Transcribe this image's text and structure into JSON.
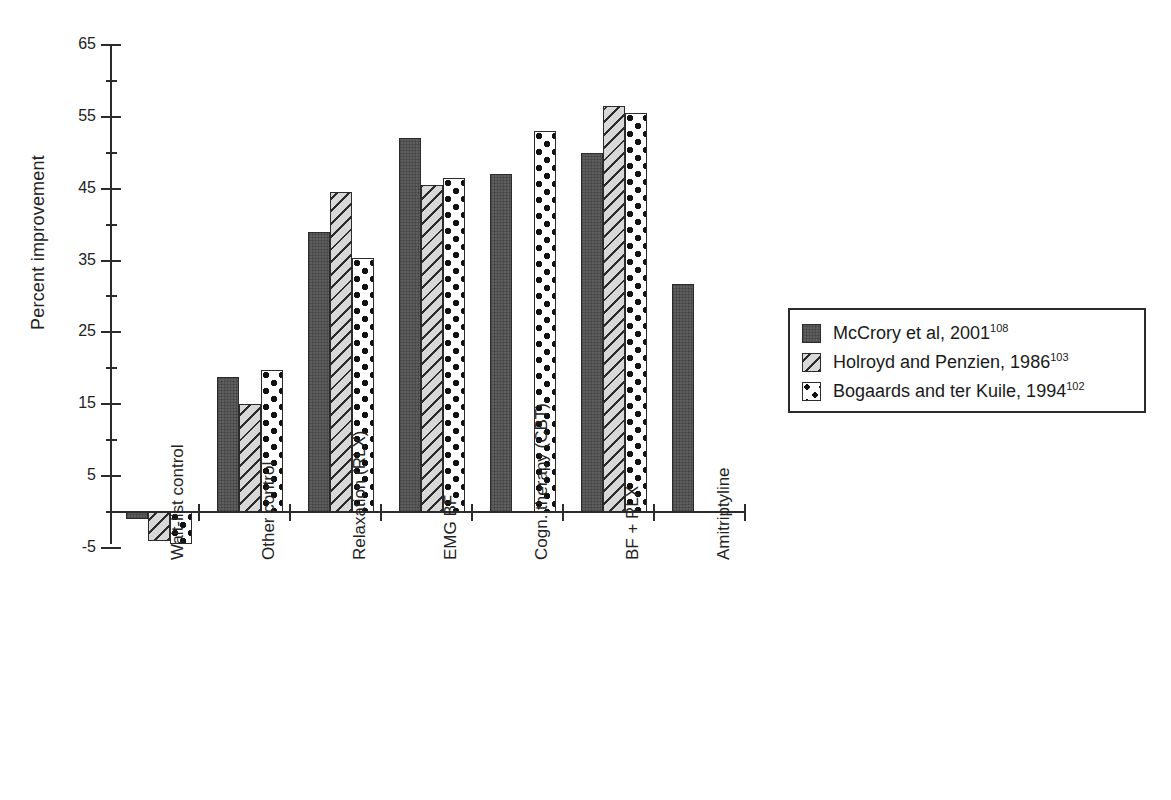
{
  "chart_data": {
    "type": "bar",
    "title": "",
    "xlabel": "",
    "ylabel": "Percent improvement",
    "ylim": [
      -5,
      65
    ],
    "ytick_labels": [
      "-5",
      "5",
      "15",
      "25",
      "35",
      "45",
      "55",
      "65"
    ],
    "ytick_values": [
      -5,
      5,
      15,
      25,
      35,
      45,
      55,
      65
    ],
    "minor_tick_values": [
      0,
      10,
      20,
      30,
      40,
      50,
      60
    ],
    "grid": false,
    "legend_position": "right",
    "categories": [
      "Wait-list control",
      "Other control",
      "Relaxation (RLX)",
      "EMG BF",
      "Cogn. therapy (CBT)",
      "BF + RLX",
      "Amitriptyline"
    ],
    "series": [
      {
        "name": "McCrory et al, 2001",
        "superscript": "108",
        "pattern": "solid-dark-gray",
        "color": "#5e5e5e",
        "values": [
          -1,
          18.8,
          39,
          52,
          47,
          50,
          31.7
        ]
      },
      {
        "name": "Holroyd and Penzien, 1986",
        "superscript": "103",
        "pattern": "diagonal-hatch",
        "color": "#d8d8d8",
        "values": [
          -4,
          15,
          44.5,
          45.5,
          null,
          56.5,
          null
        ]
      },
      {
        "name": "Bogaards and ter Kuile, 1994",
        "superscript": "102",
        "pattern": "white-with-dots",
        "color": "#ffffff",
        "values": [
          -4.5,
          19.8,
          35.3,
          46.5,
          53,
          55.5,
          null
        ]
      }
    ]
  },
  "legend": {
    "items": [
      {
        "label": "McCrory et al, 2001",
        "superscript": "108",
        "pattern": "solid"
      },
      {
        "label": "Holroyd and Penzien, 1986",
        "superscript": "103",
        "pattern": "hatch"
      },
      {
        "label": "Bogaards and ter Kuile, 1994",
        "superscript": "102",
        "pattern": "dots"
      }
    ]
  }
}
